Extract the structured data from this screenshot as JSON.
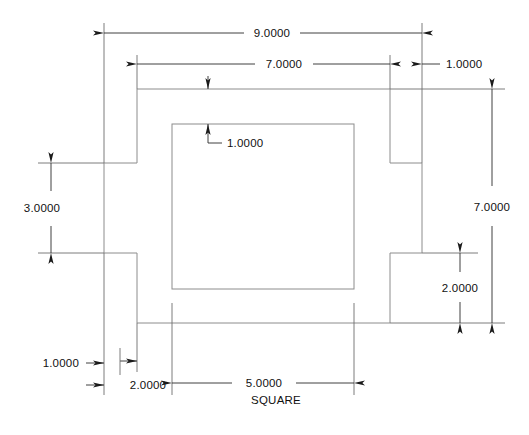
{
  "drawing": {
    "title": "Mechanical part dimensioned drawing",
    "background_color": "#ffffff",
    "outline_color": "#8c8c8c",
    "dimension_color": "#2b2b2b",
    "text_color": "#111111",
    "note_text": "SQUARE",
    "dimensions": [
      {
        "id": "overall-width",
        "label": "9.0000",
        "value": 9.0,
        "orientation": "horizontal",
        "position": "top"
      },
      {
        "id": "body-width",
        "label": "7.0000",
        "value": 7.0,
        "orientation": "horizontal",
        "position": "top"
      },
      {
        "id": "right-tab-width",
        "label": "1.0000",
        "value": 1.0,
        "orientation": "horizontal",
        "position": "top-right"
      },
      {
        "id": "wall-thickness-top",
        "label": "1.0000",
        "value": 1.0,
        "orientation": "vertical",
        "position": "inner-top"
      },
      {
        "id": "left-tab-height",
        "label": "3.0000",
        "value": 3.0,
        "orientation": "vertical",
        "position": "left"
      },
      {
        "id": "overall-height",
        "label": "7.0000",
        "value": 7.0,
        "orientation": "vertical",
        "position": "right"
      },
      {
        "id": "lower-right-height",
        "label": "2.0000",
        "value": 2.0,
        "orientation": "vertical",
        "position": "right-inner"
      },
      {
        "id": "bottom-offset",
        "label": "1.0000",
        "value": 1.0,
        "orientation": "horizontal",
        "position": "bottom-left"
      },
      {
        "id": "bottom-step",
        "label": "2.0000",
        "value": 2.0,
        "orientation": "horizontal",
        "position": "bottom-left"
      },
      {
        "id": "square-cutout-width",
        "label": "5.0000",
        "value": 5.0,
        "orientation": "horizontal",
        "position": "bottom"
      }
    ]
  }
}
